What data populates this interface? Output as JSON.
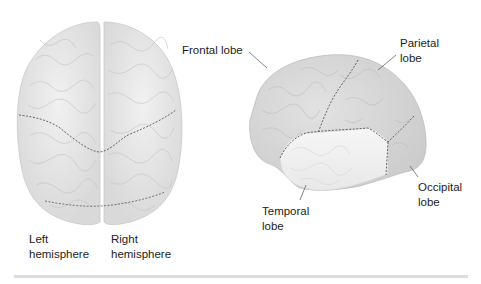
{
  "diagram": {
    "type": "anatomical-illustration",
    "views": [
      {
        "name": "top-view",
        "labels": [
          {
            "id": "left_hemisphere",
            "line1": "Left",
            "line2": "hemisphere"
          },
          {
            "id": "right_hemisphere",
            "line1": "Right",
            "line2": "hemisphere"
          }
        ]
      },
      {
        "name": "side-view",
        "labels": [
          {
            "id": "frontal",
            "line1": "Frontal lobe",
            "line2": ""
          },
          {
            "id": "parietal",
            "line1": "Parietal",
            "line2": "lobe"
          },
          {
            "id": "temporal",
            "line1": "Temporal",
            "line2": "lobe"
          },
          {
            "id": "occipital",
            "line1": "Occipital",
            "line2": "lobe"
          }
        ]
      }
    ],
    "colors": {
      "brain_base": "#e4e4e4",
      "brain_shade": "#cfcfcf",
      "temporal_fill": "#f0f0f0",
      "boundary_dash": "#555555",
      "leader_line": "#666666",
      "text": "#1c1c1c"
    }
  },
  "labels": {
    "left_l1": "Left",
    "left_l2": "hemisphere",
    "right_l1": "Right",
    "right_l2": "hemisphere",
    "frontal": "Frontal lobe",
    "parietal_l1": "Parietal",
    "parietal_l2": "lobe",
    "temporal_l1": "Temporal",
    "temporal_l2": "lobe",
    "occipital_l1": "Occipital",
    "occipital_l2": "lobe"
  }
}
